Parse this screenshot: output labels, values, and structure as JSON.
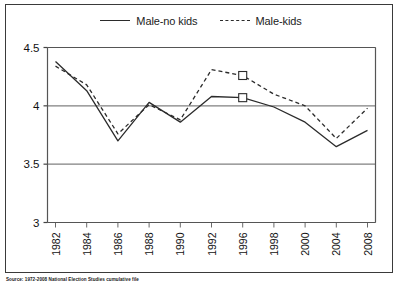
{
  "figure": {
    "source_note": "Source: 1972-2008 National Election Studies cumulative file",
    "legend": [
      {
        "label": "Male-no kids",
        "style": "solid"
      },
      {
        "label": "Male-kids",
        "style": "dashed"
      }
    ]
  },
  "chart_data": {
    "type": "line",
    "title": "",
    "subtitle": "",
    "xlabel": "",
    "ylabel": "",
    "grid": true,
    "legend_position": "top-center",
    "categories": [
      "1982",
      "1984",
      "1986",
      "1988",
      "1990",
      "1992",
      "1996",
      "1998",
      "2000",
      "2004",
      "2008"
    ],
    "ylim": [
      3,
      4.5
    ],
    "yticks": [
      "3",
      "3.5",
      "4",
      "4.5"
    ],
    "ytick_values": [
      3,
      3.5,
      4,
      4.5
    ],
    "series": [
      {
        "name": "Male-no kids",
        "style": "solid",
        "color": "#2b2b2b",
        "marker": "square",
        "marker_at": [
          "1996"
        ],
        "values": [
          4.38,
          4.13,
          3.7,
          4.03,
          3.86,
          4.08,
          4.07,
          3.99,
          3.86,
          3.65,
          3.79
        ]
      },
      {
        "name": "Male-kids",
        "style": "dashed",
        "color": "#2b2b2b",
        "marker": "square",
        "marker_at": [
          "1996"
        ],
        "values": [
          4.34,
          4.18,
          3.76,
          4.01,
          3.88,
          4.31,
          4.26,
          4.1,
          4.0,
          3.72,
          3.98
        ]
      }
    ]
  }
}
